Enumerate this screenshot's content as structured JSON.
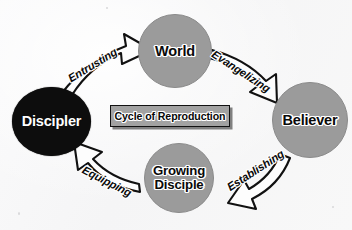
{
  "diagram": {
    "title": "Cycle of Reproduction",
    "background_color": "#f8f8f9",
    "center_plaque": {
      "label": "Cycle of Reproduction",
      "fill_color": "#a2a2a2",
      "border_color": "#111111"
    },
    "nodes": [
      {
        "id": "discipler",
        "label": "Discipler",
        "fill_color": "#0d0d0d",
        "text_color": "#ffffff",
        "position": "left"
      },
      {
        "id": "world",
        "label": "World",
        "fill_color": "#9b9b9b",
        "text_color": "#0a0a0a",
        "position": "top"
      },
      {
        "id": "believer",
        "label": "Believer",
        "fill_color": "#9b9b9b",
        "text_color": "#0a0a0a",
        "position": "right"
      },
      {
        "id": "growing-disciple",
        "label": "Growing\nDisciple",
        "fill_color": "#9b9b9b",
        "text_color": "#0a0a0a",
        "position": "bottom"
      }
    ],
    "arrows": [
      {
        "id": "entrusting",
        "label": "Entrusting",
        "from": "discipler",
        "to": "world",
        "direction": "up-right",
        "fill_color": "#ffffff",
        "outline_color": "#111111"
      },
      {
        "id": "evangelizing",
        "label": "Evangelizing",
        "from": "world",
        "to": "believer",
        "direction": "down-right",
        "fill_color": "#ffffff",
        "outline_color": "#111111"
      },
      {
        "id": "establishing",
        "label": "Establishing",
        "from": "believer",
        "to": "growing-disciple",
        "direction": "down-left",
        "fill_color": "#ffffff",
        "outline_color": "#111111"
      },
      {
        "id": "equipping",
        "label": "Equipping",
        "from": "growing-disciple",
        "to": "discipler",
        "direction": "up-left",
        "fill_color": "#ffffff",
        "outline_color": "#111111"
      }
    ]
  }
}
